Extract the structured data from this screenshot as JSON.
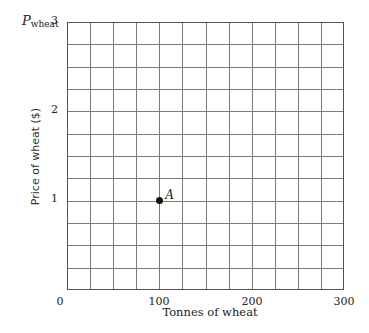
{
  "chart_data": {
    "type": "scatter",
    "title": "",
    "xlabel": "Tonnes of wheat",
    "ylabel": "Price of wheat ($)",
    "y_variable_label": "P",
    "y_variable_sub": "wheat",
    "xlim": [
      0,
      300
    ],
    "ylim": [
      0,
      3
    ],
    "x_ticks": [
      "0",
      "100",
      "200",
      "300"
    ],
    "y_ticks": [
      "1",
      "2",
      "3"
    ],
    "grid": true,
    "grid_columns": 12,
    "grid_rows": 12,
    "points": [
      {
        "label": "A",
        "x": 100,
        "y": 1
      }
    ],
    "colors": {
      "grid": "#7a7a7a",
      "point": "#111111"
    }
  }
}
